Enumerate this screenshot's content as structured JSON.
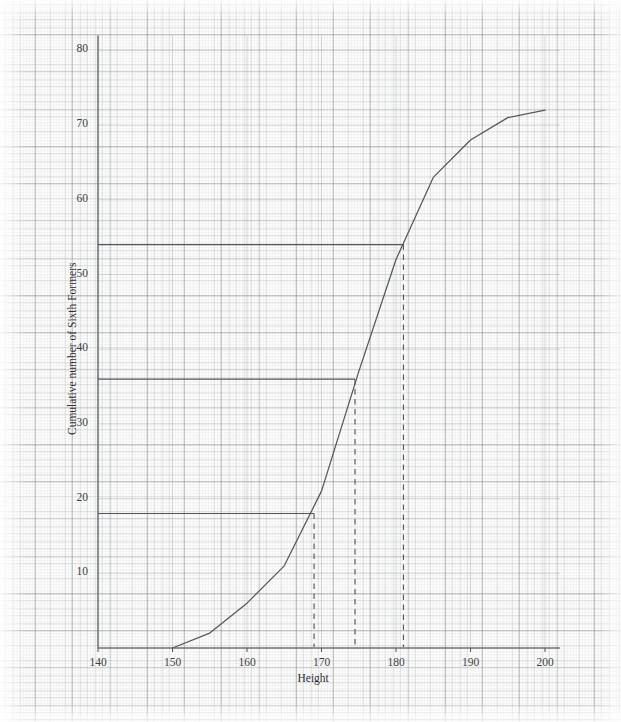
{
  "figure": {
    "kind": "cumulative-frequency-graph",
    "paper": "graph-paper",
    "ink_color": "#55565c",
    "grid_color": "#8a8e96"
  },
  "axes": {
    "x_title": "Height",
    "y_title": "Cumulative number of Sixth Formers",
    "x_ticks": [
      {
        "value": 140,
        "label": "140"
      },
      {
        "value": 150,
        "label": "150"
      },
      {
        "value": 160,
        "label": "160"
      },
      {
        "value": 170,
        "label": "170"
      },
      {
        "value": 180,
        "label": "180"
      },
      {
        "value": 190,
        "label": "190"
      },
      {
        "value": 200,
        "label": "200"
      }
    ],
    "y_ticks": [
      {
        "value": 10,
        "label": "10"
      },
      {
        "value": 20,
        "label": "20"
      },
      {
        "value": 30,
        "label": "30"
      },
      {
        "value": 40,
        "label": "40"
      },
      {
        "value": 50,
        "label": "50"
      },
      {
        "value": 60,
        "label": "60"
      },
      {
        "value": 70,
        "label": "70"
      },
      {
        "value": 80,
        "label": "80"
      }
    ]
  },
  "chart_data": {
    "type": "line",
    "title": "",
    "subtitle": "",
    "xlabel": "Height",
    "ylabel": "Cumulative number of Sixth Formers",
    "xlim": [
      140,
      202
    ],
    "ylim": [
      0,
      82
    ],
    "grid": true,
    "legend": null,
    "series": [
      {
        "name": "Cumulative frequency",
        "x": [
          150,
          155,
          160,
          165,
          170,
          175,
          180,
          185,
          190,
          195,
          200
        ],
        "values": [
          0,
          2,
          6,
          11,
          21,
          37,
          52,
          63,
          68,
          71,
          72
        ]
      }
    ],
    "annotations": [
      {
        "name": "lower-quartile-construction",
        "kind": "reading-line",
        "cumulative_frequency": 18,
        "height": 169,
        "horizontal_from_x": 140,
        "vertical_to_y": 0
      },
      {
        "name": "median-construction",
        "kind": "reading-line",
        "cumulative_frequency": 36,
        "height": 174.5,
        "horizontal_from_x": 140,
        "vertical_to_y": 0
      },
      {
        "name": "upper-quartile-construction",
        "kind": "reading-line",
        "cumulative_frequency": 54,
        "height": 181,
        "horizontal_from_x": 140,
        "vertical_to_y": 0
      }
    ]
  }
}
